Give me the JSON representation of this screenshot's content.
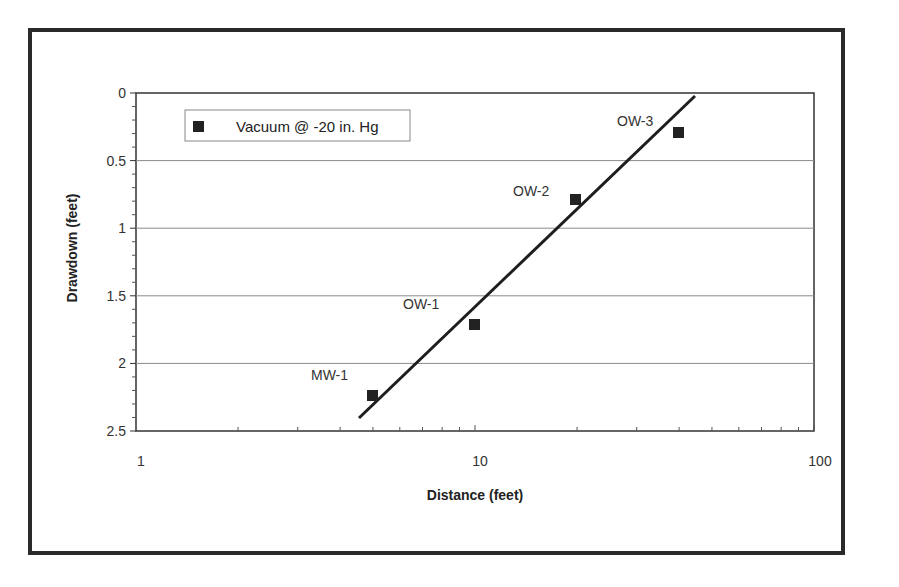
{
  "chart_data": {
    "type": "scatter",
    "title": "",
    "xlabel": "Distance (feet)",
    "ylabel": "Drawdown (feet)",
    "xscale": "log",
    "xlim": [
      1,
      100
    ],
    "ylim": [
      0,
      2.5
    ],
    "y_inverted": true,
    "x_ticks": [
      "1",
      "10",
      "100"
    ],
    "y_ticks": [
      "0",
      "0.5",
      "1",
      "1.5",
      "2",
      "2.5"
    ],
    "grid": {
      "horizontal": true,
      "vertical": false
    },
    "legend": {
      "position": "upper-left",
      "entries": [
        "Vacuum @ -20 in. Hg"
      ]
    },
    "series": [
      {
        "name": "Vacuum @ -20 in. Hg",
        "marker": "square",
        "color": "#222222",
        "points": [
          {
            "label": "MW-1",
            "x": 5,
            "y": 2.25
          },
          {
            "label": "OW-1",
            "x": 10,
            "y": 1.72
          },
          {
            "label": "OW-2",
            "x": 20,
            "y": 0.79
          },
          {
            "label": "OW-3",
            "x": 40,
            "y": 0.29
          }
        ]
      }
    ],
    "trendline": {
      "type": "log-linear fit",
      "from": {
        "x": 4.5,
        "y": 2.4
      },
      "to": {
        "x": 44.5,
        "y": 0.02
      }
    }
  },
  "labels": {
    "xlabel": "Distance (feet)",
    "ylabel": "Drawdown (feet)",
    "legend": "Vacuum @ -20 in. Hg",
    "x_ticks": [
      "1",
      "10",
      "100"
    ],
    "y_ticks": [
      "0",
      "0.5",
      "1",
      "1.5",
      "2",
      "2.5"
    ],
    "points": [
      "MW-1",
      "OW-1",
      "OW-2",
      "OW-3"
    ]
  },
  "colors": {
    "frame": "#2a2a2a",
    "axis": "#333333",
    "grid": "#888888",
    "marker": "#222222",
    "line": "#1e1e1e"
  }
}
